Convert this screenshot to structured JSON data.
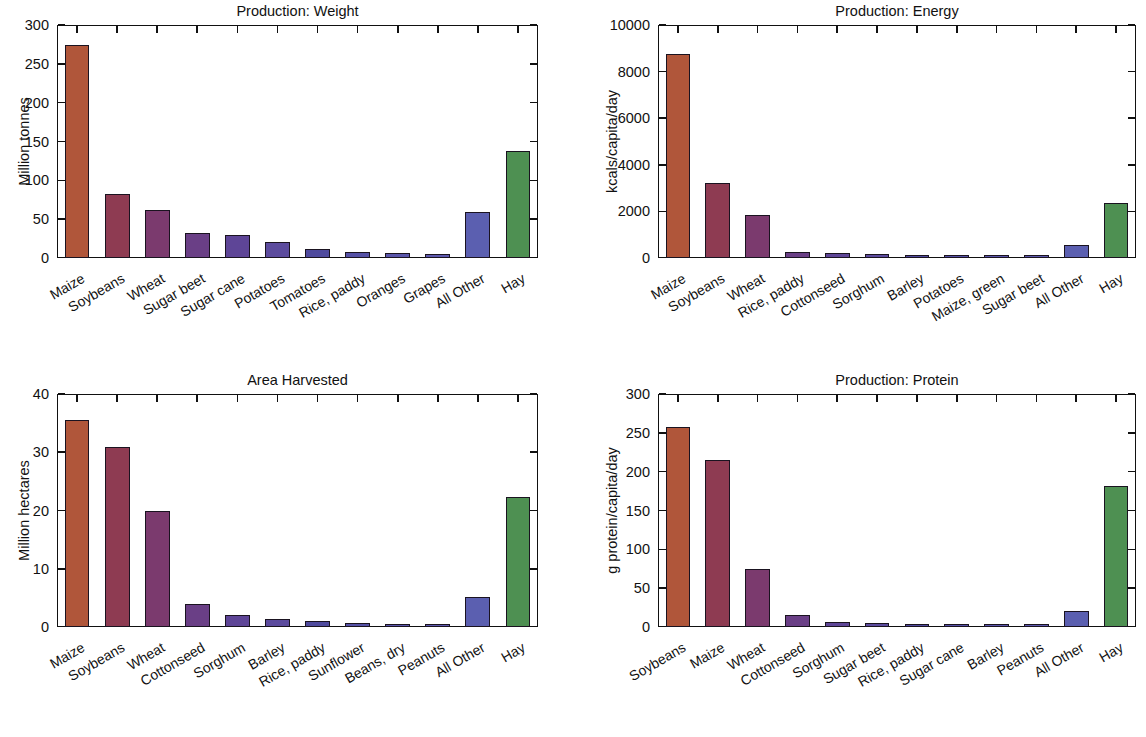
{
  "figure": {
    "background": "#ffffff",
    "bar_edge_color": "#1a1320",
    "panel_count": 4
  },
  "palette": {
    "c1": "#b0563a",
    "c2": "#8e3b52",
    "c3": "#7b3a6e",
    "c4": "#6a3f86",
    "c5": "#5e4597",
    "c6": "#5c4b9e",
    "c7": "#4f4a9e",
    "c8": "#5551a6",
    "c9": "#5a56ab",
    "c10": "#5d59ae",
    "all_other": "#5b5fb0",
    "hay": "#4e9052"
  },
  "chart_data": [
    {
      "id": "production-weight",
      "type": "bar",
      "title": "Production: Weight",
      "xlabel": "",
      "ylabel": "Million tonnes",
      "ylim": [
        0,
        300
      ],
      "yticks": [
        0,
        50,
        100,
        150,
        200,
        250,
        300
      ],
      "ytick_labels": [
        "0",
        "50",
        "100",
        "150",
        "200",
        "250",
        "300"
      ],
      "grid": false,
      "legend": "none",
      "categories": [
        "Maize",
        "Soybeans",
        "Wheat",
        "Sugar beet",
        "Sugar cane",
        "Potatoes",
        "Tomatoes",
        "Rice, paddy",
        "Oranges",
        "Grapes",
        "All Other",
        "Hay"
      ],
      "values": [
        274,
        83,
        62,
        32,
        29,
        20,
        12,
        8,
        7,
        5,
        59,
        138
      ]
    },
    {
      "id": "production-energy",
      "type": "bar",
      "title": "Production: Energy",
      "xlabel": "",
      "ylabel": "kcals/capita/day",
      "ylim": [
        0,
        10000
      ],
      "yticks": [
        0,
        2000,
        4000,
        6000,
        8000,
        10000
      ],
      "ytick_labels": [
        "0",
        "2000",
        "4000",
        "6000",
        "8000",
        "10000"
      ],
      "grid": false,
      "legend": "none",
      "categories": [
        "Maize",
        "Soybeans",
        "Wheat",
        "Rice, paddy",
        "Cottonseed",
        "Sorghum",
        "Barley",
        "Potatoes",
        "Maize, green",
        "Sugar beet",
        "All Other",
        "Hay"
      ],
      "values": [
        8750,
        3200,
        1840,
        270,
        210,
        160,
        120,
        100,
        95,
        85,
        570,
        2350
      ]
    },
    {
      "id": "area-harvested",
      "type": "bar",
      "title": "Area Harvested",
      "xlabel": "",
      "ylabel": "Million hectares",
      "ylim": [
        0,
        40
      ],
      "yticks": [
        0,
        10,
        20,
        30,
        40
      ],
      "ytick_labels": [
        "0",
        "10",
        "20",
        "30",
        "40"
      ],
      "grid": false,
      "legend": "none",
      "categories": [
        "Maize",
        "Soybeans",
        "Wheat",
        "Cottonseed",
        "Sorghum",
        "Barley",
        "Rice, paddy",
        "Sunflower",
        "Beans, dry",
        "Peanuts",
        "All Other",
        "Hay"
      ],
      "values": [
        35.5,
        30.9,
        19.9,
        3.9,
        2.0,
        1.3,
        1.0,
        0.65,
        0.6,
        0.55,
        5.2,
        22.3
      ]
    },
    {
      "id": "production-protein",
      "type": "bar",
      "title": "Production: Protein",
      "xlabel": "",
      "ylabel": "g protein/capita/day",
      "ylim": [
        0,
        300
      ],
      "yticks": [
        0,
        50,
        100,
        150,
        200,
        250,
        300
      ],
      "ytick_labels": [
        "0",
        "50",
        "100",
        "150",
        "200",
        "250",
        "300"
      ],
      "grid": false,
      "legend": "none",
      "categories": [
        "Soybeans",
        "Maize",
        "Wheat",
        "Cottonseed",
        "Sorghum",
        "Sugar beet",
        "Rice, paddy",
        "Sugar cane",
        "Barley",
        "Peanuts",
        "All Other",
        "Hay"
      ],
      "values": [
        258,
        215,
        75,
        15,
        6,
        5,
        4.5,
        4,
        3.5,
        3,
        20,
        181
      ]
    }
  ]
}
